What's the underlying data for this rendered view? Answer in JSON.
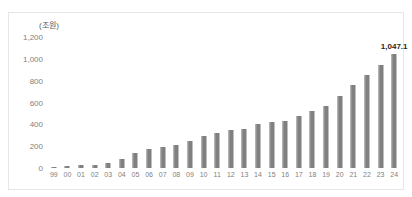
{
  "chart_data": {
    "type": "bar",
    "title": "",
    "subtitle": "",
    "unit_label": "(조원)",
    "xlabel": "",
    "ylabel": "",
    "ylim": [
      0,
      1200
    ],
    "ytick_labels": [
      "1,200",
      "1,000",
      "800",
      "600",
      "400",
      "200",
      "0"
    ],
    "ytick_values": [
      1200,
      1000,
      800,
      600,
      400,
      200,
      0
    ],
    "grid": false,
    "legend": null,
    "categories": [
      "99",
      "00",
      "01",
      "02",
      "03",
      "04",
      "05",
      "06",
      "07",
      "08",
      "09",
      "10",
      "11",
      "12",
      "13",
      "14",
      "15",
      "16",
      "17",
      "18",
      "19",
      "20",
      "21",
      "22",
      "23",
      "24"
    ],
    "values": [
      12,
      18,
      24,
      30,
      45,
      80,
      140,
      175,
      195,
      215,
      250,
      290,
      320,
      345,
      355,
      400,
      425,
      435,
      480,
      520,
      570,
      660,
      760,
      855,
      945,
      1047.1
    ],
    "series": [
      {
        "name": "",
        "values": [
          12,
          18,
          24,
          30,
          45,
          80,
          140,
          175,
          195,
          215,
          250,
          290,
          320,
          345,
          355,
          400,
          425,
          435,
          480,
          520,
          570,
          660,
          760,
          855,
          945,
          1047.1
        ]
      }
    ],
    "annotations": [
      {
        "category": "24",
        "text": "1,047.1",
        "value": 1047.1
      }
    ],
    "bar_color": "#808080",
    "bar_edge_color": "#a6a6a6",
    "axis_text_color": "#7f7f7f",
    "frame_color": "#e6e6e6",
    "background_color": "#ffffff"
  }
}
